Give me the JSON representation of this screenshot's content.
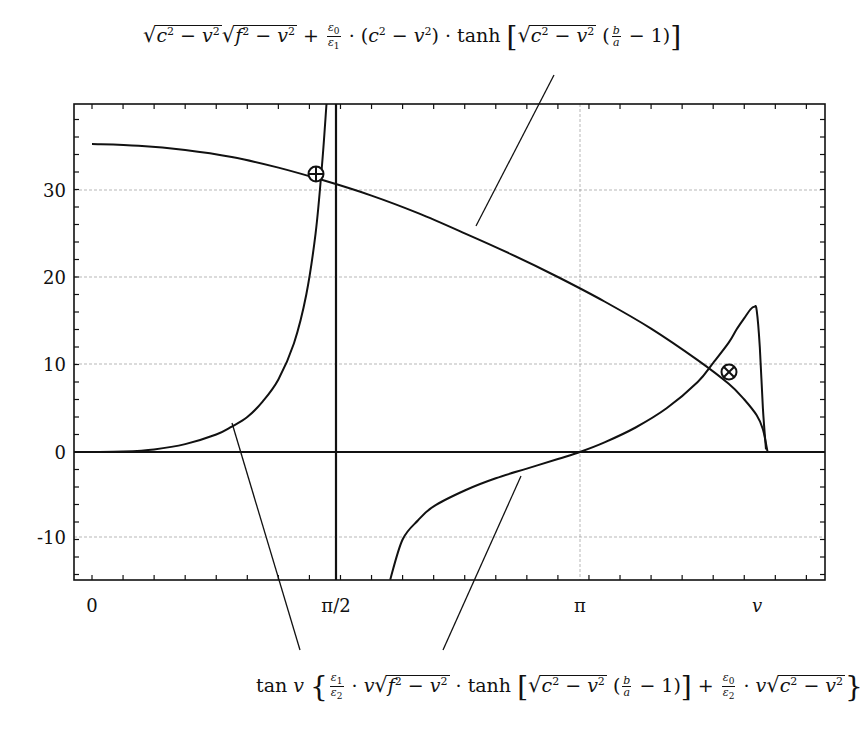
{
  "chart_data": {
    "type": "line",
    "title": "",
    "xlabel": "v",
    "ylabel": "",
    "xlim": [
      -0.116,
      4.72
    ],
    "ylim": [
      -14.6,
      39.8
    ],
    "grid": true,
    "x_ticks": [
      {
        "value": 0,
        "label": "0"
      },
      {
        "value": 1.5708,
        "label": "π/2"
      },
      {
        "value": 3.1416,
        "label": "π"
      },
      {
        "value": 4.2,
        "label": "v"
      }
    ],
    "y_ticks": [
      {
        "value": -10,
        "label": "-10"
      },
      {
        "value": 0,
        "label": "0"
      },
      {
        "value": 10,
        "label": "10"
      },
      {
        "value": 20,
        "label": "20"
      },
      {
        "value": 30,
        "label": "30"
      }
    ],
    "series": [
      {
        "name": "rhs_sqrt_tanh",
        "label_top": "√(c²−v²)√(f²−v²) + (ε0/ε1)·(c²−v²)·tanh[√(c²−v²)(b/a − 1)]",
        "x": [
          0.0,
          0.3,
          0.6,
          0.9,
          1.2,
          1.5,
          1.8,
          2.1,
          2.4,
          2.7,
          3.0,
          3.3,
          3.6,
          3.9,
          4.1,
          4.2,
          4.28,
          4.32,
          4.35
        ],
        "y": [
          35.2,
          35.0,
          34.5,
          33.7,
          32.5,
          31.0,
          29.3,
          27.3,
          25.0,
          22.6,
          20.0,
          17.2,
          14.1,
          10.5,
          7.8,
          6.0,
          4.2,
          2.6,
          0.0
        ]
      },
      {
        "name": "lhs_tan_branch1",
        "label_bottom": "tan v {(ε1/ε2)·v√(f²−v²)·tanh[√(c²−v²)(b/a − 1)] + (ε0/ε2)·v√(c²−v²)}",
        "x": [
          0.0,
          0.2,
          0.4,
          0.6,
          0.8,
          0.9,
          1.0,
          1.1,
          1.2,
          1.3,
          1.38,
          1.44,
          1.48,
          1.51
        ],
        "y": [
          0.0,
          0.05,
          0.3,
          0.9,
          2.0,
          2.9,
          4.0,
          5.8,
          8.3,
          12.4,
          18.0,
          25.0,
          32.5,
          40.0
        ]
      },
      {
        "name": "lhs_tan_branch2",
        "x": [
          1.92,
          2.0,
          2.1,
          2.2,
          2.4,
          2.6,
          2.8,
          3.0,
          3.1416,
          3.3,
          3.5,
          3.7,
          3.9,
          4.0,
          4.1,
          4.15,
          4.2,
          4.24,
          4.265,
          4.28,
          4.3,
          4.32,
          4.34
        ],
        "y": [
          -14.6,
          -10.0,
          -7.8,
          -6.2,
          -4.4,
          -3.0,
          -1.9,
          -0.8,
          0.0,
          1.1,
          2.8,
          5.0,
          8.0,
          10.2,
          12.5,
          14.0,
          15.3,
          16.3,
          16.6,
          16.2,
          12.0,
          5.0,
          0.3
        ]
      }
    ],
    "vertical_lines": [
      {
        "x": 1.5708,
        "style": "bold",
        "meaning": "asymptote at π/2"
      }
    ],
    "intersections": [
      {
        "x": 1.44,
        "y": 31.8,
        "marker": "circle-plus"
      },
      {
        "x": 4.1,
        "y": 9.1,
        "marker": "circle-x"
      }
    ]
  },
  "labels": {
    "x0": "0",
    "xpi2": "π/2",
    "xpi": "π",
    "xv": "v",
    "y30": "30",
    "y20": "20",
    "y10": "10",
    "y0": "0",
    "ym10": "-10"
  }
}
